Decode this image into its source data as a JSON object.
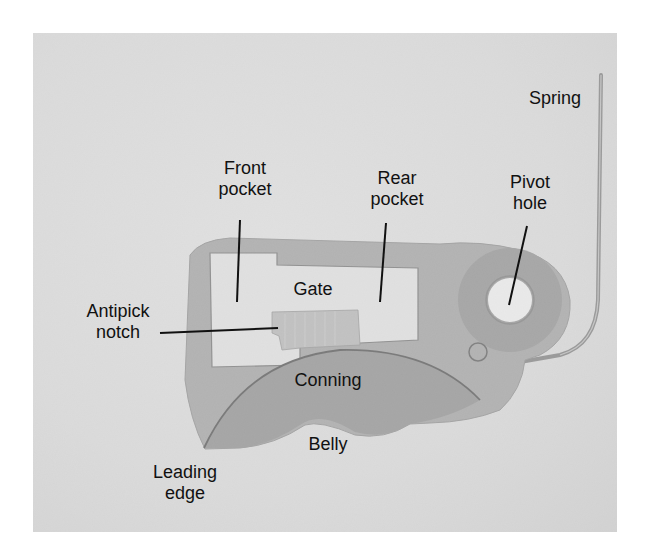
{
  "figure": {
    "labels": [
      {
        "id": "spring",
        "text": "Spring",
        "x": 515,
        "y": 88,
        "w": 80
      },
      {
        "id": "front-pocket",
        "text": "Front\npocket",
        "x": 200,
        "y": 158,
        "w": 90
      },
      {
        "id": "rear-pocket",
        "text": "Rear\npocket",
        "x": 352,
        "y": 168,
        "w": 90
      },
      {
        "id": "pivot-hole",
        "text": "Pivot\nhole",
        "x": 490,
        "y": 172,
        "w": 80
      },
      {
        "id": "gate",
        "text": "Gate",
        "x": 278,
        "y": 279,
        "w": 70
      },
      {
        "id": "antipick-notch",
        "text": "Antipick\nnotch",
        "x": 68,
        "y": 301,
        "w": 100
      },
      {
        "id": "conning",
        "text": "Conning",
        "x": 283,
        "y": 370,
        "w": 90
      },
      {
        "id": "belly",
        "text": "Belly",
        "x": 293,
        "y": 434,
        "w": 70
      },
      {
        "id": "leading-edge",
        "text": "Leading\nedge",
        "x": 135,
        "y": 462,
        "w": 100
      }
    ],
    "colors": {
      "background": "#dcdcdc",
      "lever_plate": "#9a9a9a",
      "lever_dark": "#7d7d7d",
      "pocket": "#e6e6e6",
      "text": "#111111"
    }
  }
}
